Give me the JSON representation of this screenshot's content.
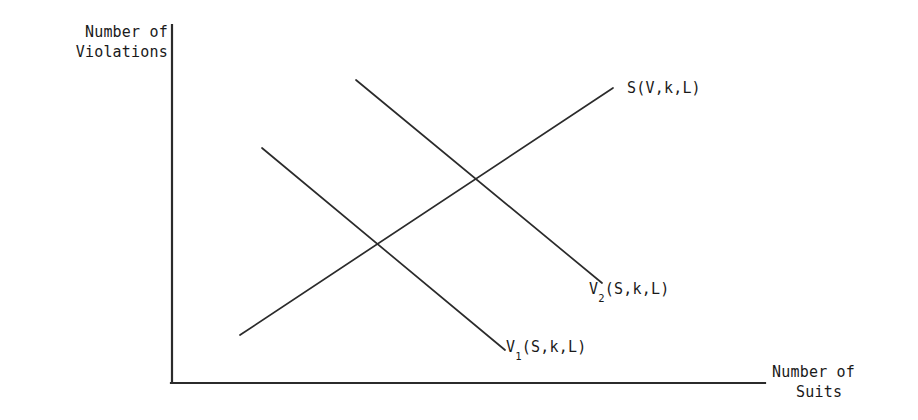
{
  "figure": {
    "name": "supply-violations-line-diagram",
    "background_color": "#ffffff",
    "line_color": "#2b2b2b"
  },
  "axes": {
    "y_title_line1": "Number of",
    "y_title_line2": "Violations",
    "x_title_line1": "Number of",
    "x_title_line2": "Suits"
  },
  "curves": {
    "s_label": "S(V,k,L)",
    "v2_label_base": "V",
    "v2_label_sub": "2",
    "v2_label_rest": "(S,k,L)",
    "v1_label_base": "V",
    "v1_label_sub": "1",
    "v1_label_rest": "(S,k,L)"
  },
  "chart_data": {
    "type": "line",
    "title": "",
    "xlabel": "Number of Suits",
    "ylabel": "Number of Violations",
    "grid": false,
    "legend": "inline-end-of-curve-labels",
    "axis_origin_px": [
      172,
      383
    ],
    "x_axis_end_px": [
      765,
      383
    ],
    "y_axis_top_px": [
      172,
      25
    ],
    "series": [
      {
        "name": "S(V,k,L)",
        "slope": "upward",
        "points_px": [
          [
            240,
            335
          ],
          [
            613,
            88
          ]
        ],
        "label_anchor_px": [
          627,
          88
        ]
      },
      {
        "name": "V2(S,k,L)",
        "slope": "downward",
        "points_px": [
          [
            356,
            80
          ],
          [
            602,
            283
          ]
        ],
        "label_anchor_px": [
          589,
          289
        ]
      },
      {
        "name": "V1(S,k,L)",
        "slope": "downward",
        "points_px": [
          [
            262,
            148
          ],
          [
            505,
            350
          ]
        ],
        "label_anchor_px": [
          506,
          347
        ]
      }
    ],
    "intersections_px": [
      {
        "between": [
          "S(V,k,L)",
          "V1(S,k,L)"
        ],
        "at": [
          382,
          243
        ]
      },
      {
        "between": [
          "S(V,k,L)",
          "V2(S,k,L)"
        ],
        "at": [
          476,
          182
        ]
      }
    ]
  }
}
